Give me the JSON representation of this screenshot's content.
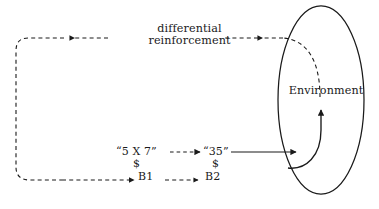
{
  "diagram": {
    "type": "flow-diagram",
    "canvas": {
      "width": 379,
      "height": 209
    },
    "stroke_color": "#1a1a1a",
    "background_color": "#ffffff"
  },
  "labels": {
    "differential_line1": "differential",
    "differential_line2": "reinforcement",
    "environment": "Environment",
    "stimulus_1": "“5 X 7”",
    "dollar_1": "$",
    "behavior_1": "B1",
    "stimulus_2": "“35”",
    "dollar_2": "$",
    "behavior_2": "B2"
  },
  "nodes": [
    {
      "id": "environment",
      "shape": "ellipse",
      "label": "Environment",
      "cx": 321,
      "cy": 100,
      "rx": 43,
      "ry": 94
    },
    {
      "id": "stim-1",
      "shape": "text",
      "label": "“5 X 7”"
    },
    {
      "id": "behavior-1",
      "shape": "text",
      "label": "B1"
    },
    {
      "id": "stim-2",
      "shape": "text",
      "label": "“35”"
    },
    {
      "id": "behavior-2",
      "shape": "text",
      "label": "B2"
    }
  ],
  "edges": [
    {
      "id": "env-exit-to-top",
      "style": "dashed",
      "arrow": "none",
      "from": "environment",
      "to": "top-rail"
    },
    {
      "id": "top-rail-right-arrow",
      "style": "dashed",
      "arrow": "left",
      "label": "differential reinforcement"
    },
    {
      "id": "top-rail-left-arrow",
      "style": "dashed",
      "arrow": "left"
    },
    {
      "id": "left-return-rail",
      "style": "dashed",
      "arrow": "none"
    },
    {
      "id": "bottom-rail-to-b1",
      "style": "dashed",
      "arrow": "right",
      "to": "behavior-1"
    },
    {
      "id": "b1-to-b2",
      "style": "dashed",
      "arrow": "right",
      "from": "behavior-1",
      "to": "behavior-2"
    },
    {
      "id": "stim1-to-stim2",
      "style": "dashed",
      "arrow": "right",
      "from": "stim-1",
      "to": "stim-2"
    },
    {
      "id": "stim2-to-environment",
      "style": "solid",
      "arrow": "right",
      "from": "stim-2",
      "to": "environment"
    },
    {
      "id": "environment-internal-curve",
      "style": "solid",
      "arrow": "up",
      "from": "environment",
      "to": "environment"
    }
  ]
}
